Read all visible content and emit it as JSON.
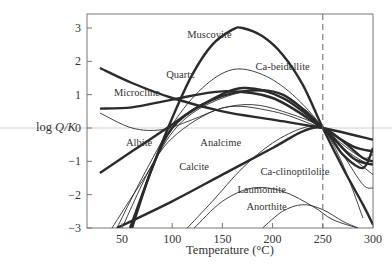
{
  "chart_data": {
    "type": "line",
    "title": "",
    "xlabel": "Temperature (°C)",
    "ylabel": "log Q/K",
    "xlim": [
      16,
      300
    ],
    "ylim": [
      -3,
      3.4
    ],
    "xticks": [
      50,
      100,
      150,
      200,
      250,
      300
    ],
    "yticks": [
      3,
      2,
      1,
      0,
      -1,
      -2,
      -3
    ],
    "grid": false,
    "reference_lines": [
      {
        "type": "vertical",
        "x": 250,
        "style": "dashed"
      },
      {
        "type": "horizontal",
        "y": 0,
        "style": "solid-faint"
      }
    ],
    "series": [
      {
        "name": "Muscovite",
        "weight": "heavy",
        "x": [
          58,
          80,
          100,
          120,
          140,
          160,
          170,
          190,
          210,
          230,
          250,
          270,
          290,
          300
        ],
        "y": [
          -3.0,
          -1.2,
          0.3,
          1.6,
          2.5,
          2.95,
          3.0,
          2.75,
          2.2,
          1.3,
          0.0,
          -1.2,
          -2.3,
          -2.9
        ]
      },
      {
        "name": "Ca-beidellite",
        "weight": "light",
        "x": [
          45,
          70,
          100,
          130,
          160,
          190,
          220,
          250,
          270,
          290
        ],
        "y": [
          -3.0,
          -1.5,
          0.1,
          1.2,
          1.75,
          1.6,
          1.0,
          0.0,
          -1.1,
          -2.7
        ]
      },
      {
        "name": "Quartz",
        "weight": "heavy",
        "x": [
          28,
          60,
          100,
          150,
          200,
          250,
          300
        ],
        "y": [
          1.8,
          1.35,
          0.9,
          0.5,
          0.25,
          0.0,
          -0.35
        ]
      },
      {
        "name": "Microcline",
        "weight": "heavy",
        "x": [
          28,
          60,
          100,
          150,
          200,
          250,
          280,
          300
        ],
        "y": [
          0.58,
          0.62,
          0.85,
          1.1,
          0.9,
          0.0,
          -0.55,
          -0.7
        ]
      },
      {
        "name": "Albite",
        "weight": "heavy",
        "x": [
          28,
          60,
          90,
          130,
          170,
          210,
          250,
          280,
          300
        ],
        "y": [
          -1.35,
          -0.7,
          -0.1,
          0.7,
          1.2,
          0.9,
          0.0,
          -0.9,
          -1.1
        ]
      },
      {
        "name": "Analcime",
        "weight": "light",
        "x": [
          28,
          60,
          90,
          120,
          150,
          180,
          210,
          250,
          280,
          300
        ],
        "y": [
          0.45,
          0.0,
          -0.05,
          0.25,
          0.6,
          0.7,
          0.5,
          0.0,
          -0.9,
          -1.4
        ]
      },
      {
        "name": "Calcite",
        "weight": "heavy",
        "x": [
          45,
          100,
          150,
          200,
          230,
          250,
          270,
          290,
          300
        ],
        "y": [
          -3.0,
          -2.2,
          -1.4,
          -0.6,
          -0.1,
          0.0,
          -0.4,
          -0.9,
          -1.0
        ]
      },
      {
        "name": "Ca-clinoptilolite",
        "weight": "light",
        "x": [
          115,
          140,
          170,
          200,
          230,
          250,
          270,
          290,
          300
        ],
        "y": [
          -3.0,
          -2.2,
          -1.2,
          -0.45,
          0.0,
          0.0,
          -0.8,
          -1.7,
          -1.8
        ]
      },
      {
        "name": "Laumontite",
        "weight": "light",
        "x": [
          122,
          150,
          180,
          210,
          240,
          260,
          285
        ],
        "y": [
          -3.0,
          -2.2,
          -1.8,
          -1.9,
          -2.35,
          -2.75,
          -3.0
        ]
      },
      {
        "name": "Anorthite",
        "weight": "light",
        "x": [
          190,
          210,
          230,
          250,
          270,
          285
        ],
        "y": [
          -3.0,
          -2.5,
          -2.3,
          -2.45,
          -2.8,
          -3.0
        ]
      },
      {
        "name": "Unlabeled-heavy-1",
        "weight": "heavy",
        "x": [
          60,
          80,
          100,
          130,
          170,
          210,
          250,
          270,
          290,
          300
        ],
        "y": [
          -3.0,
          -1.2,
          0.0,
          0.7,
          1.1,
          1.0,
          0.0,
          -0.8,
          -1.2,
          -0.6
        ]
      },
      {
        "name": "Unlabeled-light-1",
        "weight": "light",
        "x": [
          50,
          80,
          110,
          150,
          190,
          230,
          250,
          270,
          290,
          300
        ],
        "y": [
          -3.0,
          -1.1,
          0.2,
          0.9,
          1.1,
          0.6,
          0.0,
          -0.6,
          -1.0,
          -1.1
        ]
      },
      {
        "name": "Unlabeled-light-2",
        "weight": "light",
        "x": [
          40,
          70,
          100,
          150,
          200,
          240,
          250,
          270,
          290,
          300
        ],
        "y": [
          -3.0,
          -1.6,
          -0.3,
          0.6,
          0.5,
          0.1,
          0.0,
          -0.5,
          -0.9,
          -0.8
        ]
      }
    ],
    "labels": [
      {
        "text": "Muscovite",
        "x": 115,
        "y": 2.7
      },
      {
        "text": "Ca-beidellite",
        "x": 183,
        "y": 1.75
      },
      {
        "text": "Quartz",
        "x": 94,
        "y": 1.5
      },
      {
        "text": "Microcline",
        "x": 42,
        "y": 0.95
      },
      {
        "text": "Albite",
        "x": 54,
        "y": -0.55
      },
      {
        "text": "Analcime",
        "x": 128,
        "y": -0.55
      },
      {
        "text": "Calcite",
        "x": 107,
        "y": -1.25
      },
      {
        "text": "Ca-clinoptilolite",
        "x": 188,
        "y": -1.4
      },
      {
        "text": "Laumontite",
        "x": 165,
        "y": -1.95
      },
      {
        "text": "Anorthite",
        "x": 174,
        "y": -2.45
      }
    ]
  },
  "axes": {
    "x_title": "Temperature (°C)",
    "y_title_prefix": "log ",
    "y_title_italic": "Q/K",
    "x_tick_labels": [
      "50",
      "100",
      "150",
      "200",
      "250",
      "300"
    ],
    "y_tick_labels": [
      "3",
      "2",
      "1",
      "0",
      "−1",
      "−2",
      "−3"
    ]
  },
  "colors": {
    "line": "#2b2b2b",
    "axis": "#777777",
    "text": "#333333",
    "zero_line": "#e8e8e8",
    "dashed": "#666666"
  }
}
